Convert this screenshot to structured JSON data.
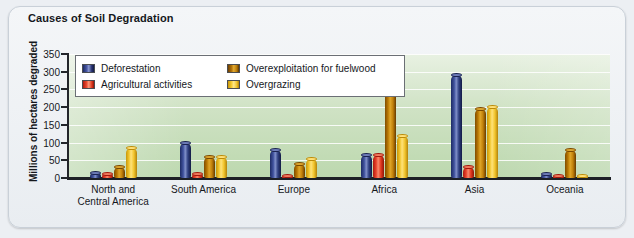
{
  "title": "Causes of Soil Degradation",
  "chart_data": {
    "type": "bar",
    "title": "Causes of Soil Degradation",
    "xlabel": "",
    "ylabel": "Millions of hectares degraded",
    "ylim": [
      0,
      350
    ],
    "yticks": [
      0,
      50,
      100,
      150,
      200,
      250,
      300,
      350
    ],
    "grid": true,
    "legend_position": "upper-left inside plot",
    "categories": [
      "North and\nCentral America",
      "South America",
      "Europe",
      "Africa",
      "Asia",
      "Oceania"
    ],
    "series": [
      {
        "name": "Deforestation",
        "color": "#2b3a80",
        "values": [
          15,
          100,
          80,
          65,
          290,
          10
        ]
      },
      {
        "name": "Agricultural activities",
        "color": "#e8412a",
        "values": [
          12,
          10,
          5,
          65,
          30,
          5
        ]
      },
      {
        "name": "Overexploitation for fuelwood",
        "color": "#b2730a",
        "values": [
          30,
          60,
          40,
          245,
          195,
          80
        ]
      },
      {
        "name": "Overgrazing",
        "color": "#f0c42a",
        "values": [
          85,
          60,
          55,
          120,
          200,
          5
        ]
      }
    ]
  },
  "legend": {
    "items": [
      {
        "label": "Deforestation",
        "swatch": "deforestation-swatch"
      },
      {
        "label": "Overexploitation for fuelwood",
        "swatch": "overexploitation-swatch"
      },
      {
        "label": "Agricultural activities",
        "swatch": "agricultural-swatch"
      },
      {
        "label": "Overgrazing",
        "swatch": "overgrazing-swatch"
      }
    ]
  }
}
